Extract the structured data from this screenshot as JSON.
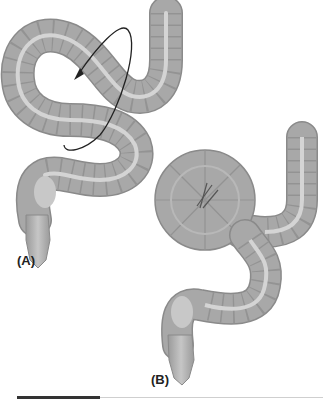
{
  "figure": {
    "panels": [
      {
        "id": "A",
        "label": "(A)",
        "content": "Redundant sigmoid colon with curved arrow indicating direction of rotation"
      },
      {
        "id": "B",
        "label": "(B)",
        "content": "Twisted sigmoid loop forming volvulus"
      }
    ],
    "colors": {
      "bowel_fill": "#a8a8a8",
      "bowel_stroke": "#8a8a8a",
      "bowel_highlight": "#d4d4d4",
      "haustra_line": "#959595",
      "arrow": "#222222",
      "rule_dark": "#333333",
      "rule_light": "#cfcfcf"
    }
  }
}
